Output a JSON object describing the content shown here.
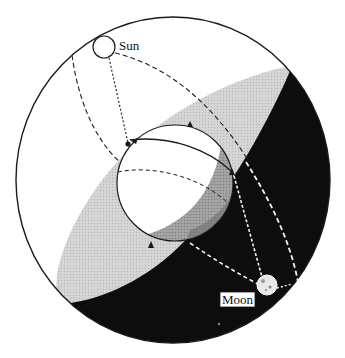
{
  "diagram": {
    "labels": {
      "sun": "Sun",
      "moon": "Moon"
    },
    "elements": {
      "outer_sphere": "celestial-sphere",
      "inner_sphere": "earth",
      "plane": "horizon-plane",
      "day_side": "illuminated-half",
      "night_side": "shadow-half"
    },
    "colors": {
      "background": "#ffffff",
      "outline": "#1a1a1a",
      "plane_light": "#cfcfcf",
      "night": "#0d0d0d",
      "earth_shadow": "#9a9a9a",
      "dash_dark": "#1a1a1a",
      "dash_light": "#f2f2f2"
    }
  }
}
